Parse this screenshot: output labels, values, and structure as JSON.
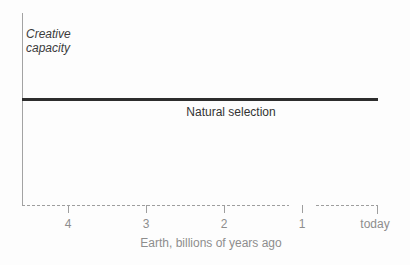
{
  "chart_data": {
    "type": "line",
    "title": "",
    "ylabel": "Creative capacity",
    "xlabel": "Earth, billions of years ago",
    "x_tick_labels": [
      "4",
      "3",
      "2",
      "1",
      "today"
    ],
    "x_axis": {
      "range_billions_of_years_ago": [
        4.6,
        0
      ],
      "direction": "past on left, today on right",
      "style": "dotted gray line with a short gap after the tick at 1",
      "grid": false
    },
    "y_axis": {
      "ticks": [],
      "qualitative": true,
      "note": "no numeric scale shown; axis is a plain vertical line"
    },
    "series": [
      {
        "name": "Natural selection",
        "shape": "constant horizontal thick line spanning the full time axis",
        "x_billions_of_years_ago": [
          4.6,
          0
        ],
        "y_relative": [
          1,
          1
        ],
        "label_position": "below line, centered"
      }
    ],
    "legend_position": "inline label below the line",
    "colors": {
      "background": "#fdfdfd",
      "series_line": "#2d2d2d",
      "axis": "#9e9e9e",
      "primary_text": "#3b3b3b",
      "axis_text": "#8d8d8d"
    }
  }
}
